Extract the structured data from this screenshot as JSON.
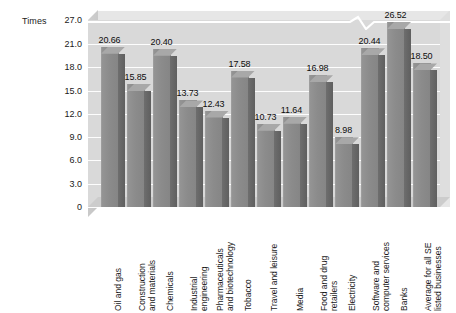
{
  "chart_data": {
    "type": "bar",
    "title": "",
    "subtitle": "",
    "xlabel": "",
    "ylabel": "Times",
    "ylim": [
      0,
      27.0
    ],
    "grid": true,
    "legend": "none",
    "axis_break": {
      "present": true,
      "between": [
        21.0,
        27.0
      ],
      "style": "zigzag-notch"
    },
    "ytick_labels": [
      "27.0",
      "21.0",
      "18.0",
      "15.0",
      "12.0",
      "9.0",
      "6.0",
      "3.0",
      "0"
    ],
    "ytick_values": [
      27.0,
      21.0,
      18.0,
      15.0,
      12.0,
      9.0,
      6.0,
      3.0,
      0
    ],
    "categories": [
      "Oil and gas",
      "Construction and materials",
      "Chemicals",
      "Industrial engineering",
      "Pharmaceuticals and biotechnology",
      "Tobacco",
      "Travel and leisure",
      "Media",
      "Food and drug retailers",
      "Electricity",
      "Software and computer services",
      "Banks",
      "Average for all SE listed businesses"
    ],
    "category_lines": [
      [
        "Oil and gas"
      ],
      [
        "Construction",
        "and materials"
      ],
      [
        "Chemicals"
      ],
      [
        "Industrial",
        "engineering"
      ],
      [
        "Pharmaceuticals",
        "and biotechnology"
      ],
      [
        "Tobacco"
      ],
      [
        "Travel and leisure"
      ],
      [
        "Media"
      ],
      [
        "Food and drug",
        "retailers"
      ],
      [
        "Electricity"
      ],
      [
        "Software and",
        "computer services"
      ],
      [
        "Banks"
      ],
      [
        "Average for all SE",
        "listed businesses"
      ]
    ],
    "values": [
      20.66,
      15.85,
      20.4,
      13.73,
      12.43,
      17.58,
      10.73,
      11.64,
      16.98,
      8.98,
      20.44,
      26.52,
      18.5
    ],
    "value_labels": [
      "20.66",
      "15.85",
      "20.40",
      "13.73",
      "12.43",
      "17.58",
      "10.73",
      "11.64",
      "16.98",
      "8.98",
      "20.44",
      "26.52",
      "18.50"
    ]
  },
  "colors": {
    "page_background": "#ffffff",
    "plot_background": "#d9d9d9",
    "gridline": "#ffffff",
    "bar_front": "#8b8b8b",
    "bar_side": "#6e6e6e",
    "bar_top": "#a8a8a8",
    "wall_left": "#c9c9c9",
    "text": "#1a1a1a"
  }
}
